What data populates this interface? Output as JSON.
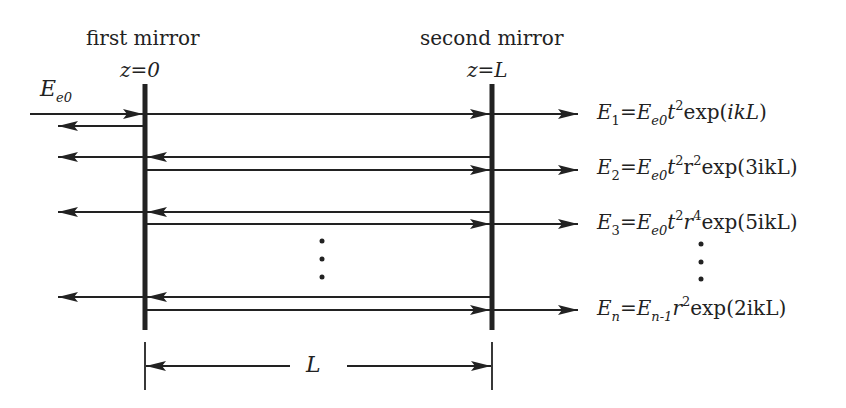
{
  "labels": {
    "first_mirror": "first mirror",
    "second_mirror": "second mirror",
    "z0": "z=0",
    "zL": "z=L",
    "input_field": {
      "main": "E",
      "sub": "e0"
    },
    "length": "L"
  },
  "equations": [
    {
      "lhs": "E",
      "lhs_sub": "1",
      "eq": "=",
      "e": "E",
      "e_sub": "e0",
      "t": "t",
      "t_sup": "2",
      "r": "",
      "r_sup": "",
      "exp": "exp(",
      "arg": "ikL",
      "close": ")"
    },
    {
      "lhs": "E",
      "lhs_sub": "2",
      "eq": "=",
      "e": "E",
      "e_sub": "e0",
      "t": "t",
      "t_sup": "2",
      "r": "r",
      "r_sup": "2",
      "exp": "exp(",
      "arg": "3ikL",
      "close": ")"
    },
    {
      "lhs": "E",
      "lhs_sub": "3",
      "eq": "=",
      "e": "E",
      "e_sub": "e0",
      "t": "t",
      "t_sup": "2",
      "r": "r",
      "r_sup": "4",
      "exp": "exp(",
      "arg": "5ikL",
      "close": ")"
    },
    {
      "lhs": "E",
      "lhs_sub": "n",
      "eq": "=",
      "e": "E",
      "e_sub": "n-1",
      "t": "",
      "t_sup": "",
      "r": "r",
      "r_sup": "2",
      "exp": "exp(",
      "arg": "2ikL",
      "close": ")"
    }
  ],
  "ellipsis": "•",
  "colors": {
    "ink": "#222222",
    "background": "#ffffff"
  }
}
